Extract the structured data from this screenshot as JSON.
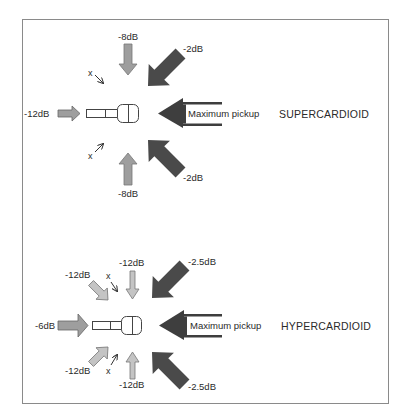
{
  "colors": {
    "border": "#8a8a8a",
    "dark_arrow": "#4a4a4a",
    "mid_arrow": "#9e9e9e",
    "light_arrow": "#c4c4c4",
    "outline": "#555555",
    "text": "#2a2a2a"
  },
  "supercardioid": {
    "title": "SUPERCARDIOID",
    "front_label": "Maximum pickup",
    "top_label": "-8dB",
    "bottom_label": "-8dB",
    "rear_label": "-12dB",
    "front_upper_label": "-2dB",
    "front_lower_label": "-2dB",
    "null_upper_marker": "x",
    "null_lower_marker": "x"
  },
  "hypercardioid": {
    "title": "HYPERCARDIOID",
    "front_label": "Maximum pickup",
    "top_label": "-12dB",
    "bottom_label": "-12dB",
    "rear_label": "-6dB",
    "rear_upper_label": "-12dB",
    "rear_lower_label": "-12dB",
    "front_upper_label": "-2.5dB",
    "front_lower_label": "-2.5dB",
    "null_upper_marker": "x",
    "null_lower_marker": "x"
  }
}
